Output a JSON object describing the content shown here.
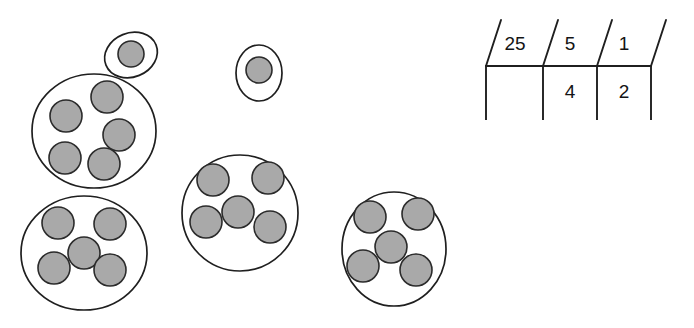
{
  "figure": {
    "canvas": {
      "width": 694,
      "height": 328,
      "background": "#ffffff"
    },
    "style": {
      "dot_fill": "#a9a9a9",
      "dot_stroke": "#2b2b2b",
      "outline_fill": "#ffffff",
      "outline_stroke": "#1f1f1f",
      "line_color": "#1f1f1f"
    }
  },
  "dot_groups": [
    {
      "name": "top-left-single-loop",
      "kind": "ellipse",
      "cx": 131,
      "cy": 55,
      "rx": 27,
      "ry": 22,
      "rotate": -22,
      "dot_count": 1,
      "dots": [
        {
          "cx": 131,
          "cy": 54,
          "r": 13
        }
      ]
    },
    {
      "name": "top-left-group-of-five",
      "kind": "ellipse",
      "cx": 94,
      "cy": 131,
      "rx": 62,
      "ry": 57,
      "rotate": 0,
      "dot_count": 5,
      "dots": [
        {
          "cx": 66,
          "cy": 116,
          "r": 16
        },
        {
          "cx": 107,
          "cy": 97,
          "r": 16
        },
        {
          "cx": 119,
          "cy": 135,
          "r": 16
        },
        {
          "cx": 65,
          "cy": 158,
          "r": 16
        },
        {
          "cx": 104,
          "cy": 164,
          "r": 16
        }
      ]
    },
    {
      "name": "top-middle-single-loop",
      "kind": "ellipse",
      "cx": 259,
      "cy": 73,
      "rx": 23,
      "ry": 28,
      "rotate": 0,
      "dot_count": 1,
      "dots": [
        {
          "cx": 259,
          "cy": 70,
          "r": 13
        }
      ]
    },
    {
      "name": "bottom-left-group-of-five",
      "kind": "ellipse",
      "cx": 84,
      "cy": 253,
      "rx": 63,
      "ry": 57,
      "rotate": 0,
      "dot_count": 5,
      "dots": [
        {
          "cx": 58,
          "cy": 223,
          "r": 16
        },
        {
          "cx": 110,
          "cy": 224,
          "r": 16
        },
        {
          "cx": 84,
          "cy": 253,
          "r": 16
        },
        {
          "cx": 54,
          "cy": 268,
          "r": 16
        },
        {
          "cx": 110,
          "cy": 270,
          "r": 16
        }
      ]
    },
    {
      "name": "middle-group-of-five",
      "kind": "ellipse",
      "cx": 240,
      "cy": 213,
      "rx": 58,
      "ry": 58,
      "rotate": 0,
      "dot_count": 5,
      "dots": [
        {
          "cx": 213,
          "cy": 180,
          "r": 16
        },
        {
          "cx": 268,
          "cy": 178,
          "r": 16
        },
        {
          "cx": 238,
          "cy": 212,
          "r": 16
        },
        {
          "cx": 206,
          "cy": 222,
          "r": 16
        },
        {
          "cx": 270,
          "cy": 227,
          "r": 16
        }
      ]
    },
    {
      "name": "right-group-of-five",
      "kind": "ellipse",
      "cx": 394,
      "cy": 249,
      "rx": 52,
      "ry": 57,
      "rotate": 0,
      "dot_count": 5,
      "dots": [
        {
          "cx": 370,
          "cy": 217,
          "r": 16
        },
        {
          "cx": 418,
          "cy": 214,
          "r": 16
        },
        {
          "cx": 391,
          "cy": 247,
          "r": 16
        },
        {
          "cx": 363,
          "cy": 266,
          "r": 16
        },
        {
          "cx": 416,
          "cy": 270,
          "r": 16
        }
      ]
    }
  ],
  "chart": {
    "name": "place-value-chart",
    "header_row": {
      "cells": [
        {
          "label": "25",
          "x": 515,
          "y": 45
        },
        {
          "label": "5",
          "x": 570,
          "y": 45
        },
        {
          "label": "1",
          "x": 624,
          "y": 45
        }
      ]
    },
    "value_row": {
      "cells": [
        {
          "label": "",
          "x": 515,
          "y": 93
        },
        {
          "label": "4",
          "x": 570,
          "y": 93
        },
        {
          "label": "2",
          "x": 624,
          "y": 93
        }
      ]
    },
    "rule": {
      "x1": 486,
      "y1": 66,
      "x2": 651,
      "y2": 66
    },
    "verticals": [
      {
        "x": 486,
        "y1": 66,
        "y2": 119
      },
      {
        "x": 543,
        "y1": 66,
        "y2": 119
      },
      {
        "x": 597,
        "y1": 66,
        "y2": 119
      },
      {
        "x": 651,
        "y1": 66,
        "y2": 119
      }
    ],
    "slashes": [
      {
        "x1": 501,
        "y1": 20,
        "x2": 486,
        "y2": 66
      },
      {
        "x1": 558,
        "y1": 20,
        "x2": 543,
        "y2": 66
      },
      {
        "x1": 612,
        "y1": 20,
        "x2": 597,
        "y2": 66
      },
      {
        "x1": 666,
        "y1": 20,
        "x2": 651,
        "y2": 66
      }
    ]
  }
}
